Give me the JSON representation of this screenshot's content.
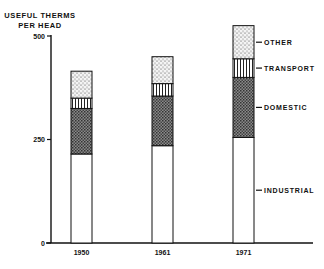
{
  "chart_data": {
    "type": "bar",
    "stacked": true,
    "title": "",
    "xlabel": "",
    "ylabel": "USEFUL THERMS PER HEAD",
    "ylim": [
      0,
      500
    ],
    "yticks": [
      0,
      250,
      500
    ],
    "categories": [
      "1950",
      "1961",
      "1971"
    ],
    "series": [
      {
        "name": "INDUSTRIAL",
        "pattern": "blank",
        "values": [
          215,
          235,
          255
        ]
      },
      {
        "name": "DOMESTIC",
        "pattern": "crosshatch",
        "values": [
          110,
          120,
          145
        ]
      },
      {
        "name": "TRANSPORT",
        "pattern": "vertical-stripes",
        "values": [
          25,
          30,
          45
        ]
      },
      {
        "name": "OTHER",
        "pattern": "stipple",
        "values": [
          65,
          65,
          80
        ]
      }
    ],
    "totals": [
      415,
      450,
      525
    ],
    "legend_position": "right, labels pointing at 1971 bar",
    "grid": false
  },
  "ylabel_line1": "USEFUL THERMS",
  "ylabel_line2": "PER HEAD"
}
